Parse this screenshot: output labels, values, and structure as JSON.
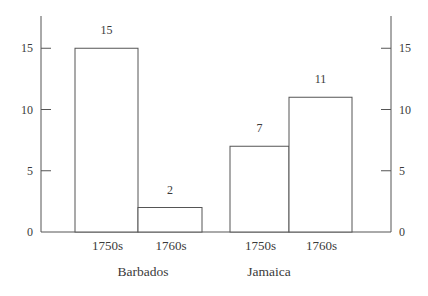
{
  "chart_data": {
    "type": "bar",
    "title": "",
    "xlabel": "",
    "ylabel": "",
    "ylim": [
      0,
      17.5
    ],
    "yticks": [
      0,
      5,
      10,
      15
    ],
    "ytick_labels": [
      "0",
      "5",
      "10",
      "15"
    ],
    "dual_y_axis": true,
    "grid": false,
    "legend": null,
    "groups": [
      {
        "name": "Barbados",
        "categories": [
          "1750s",
          "1760s"
        ],
        "values": [
          15,
          2
        ]
      },
      {
        "name": "Jamaica",
        "categories": [
          "1750s",
          "1760s"
        ],
        "values": [
          7,
          11
        ]
      }
    ],
    "categories": [
      "Barbados 1750s",
      "Barbados 1760s",
      "Jamaica 1750s",
      "Jamaica 1760s"
    ],
    "values": [
      15,
      2,
      7,
      11
    ],
    "data_labels": [
      "15",
      "2",
      "7",
      "11"
    ],
    "colors": {
      "bar_fill": "#ffffff",
      "bar_stroke": "#555555",
      "axis": "#555555",
      "text": "#3a3a3a"
    }
  }
}
